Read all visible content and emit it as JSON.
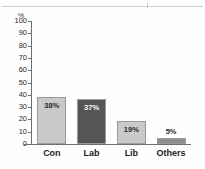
{
  "page": {
    "rule_present": true
  },
  "chart_data": {
    "type": "bar",
    "title": "",
    "subtitle": "",
    "xlabel": "",
    "ylabel": "%",
    "unit_label": "%",
    "categories": [
      "Con",
      "Lab",
      "Lib",
      "Others"
    ],
    "values": [
      38,
      37,
      19,
      5
    ],
    "data_labels": [
      "38%",
      "37%",
      "19%",
      "5%"
    ],
    "ylim": [
      0,
      100
    ],
    "ytick_labels": [
      "100",
      "90",
      "80",
      "70",
      "60",
      "50",
      "40",
      "30",
      "20",
      "10",
      "0"
    ],
    "ytick_values": [
      100,
      90,
      80,
      70,
      60,
      50,
      40,
      30,
      20,
      10,
      0
    ],
    "grid": false,
    "legend": false,
    "legend_position": "none",
    "bar_colors": [
      "#c9c9c9",
      "#555555",
      "#c9c9c9",
      "#8d8d8d"
    ],
    "bar_border_color": "#9a9a9a",
    "label_colors": [
      "#2b2b2b",
      "#ffffff",
      "#2b2b2b",
      "#2b2b2b"
    ],
    "label_placement": [
      "inside",
      "inside",
      "inside",
      "above"
    ],
    "axis_color": "#6f6f6f",
    "background_color": "#fefefe"
  }
}
